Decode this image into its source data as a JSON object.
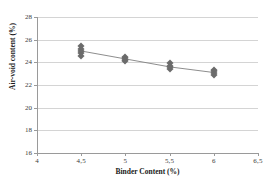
{
  "chart_data": {
    "type": "scatter",
    "title": "",
    "xlabel": "Binder Content (%)",
    "ylabel": "Air-void content (%)",
    "xlim": [
      4,
      6.5
    ],
    "ylim": [
      16,
      28
    ],
    "xticks": [
      "4",
      "4,5",
      "5",
      "5,5",
      "6",
      "6,5"
    ],
    "xtick_values": [
      4,
      4.5,
      5,
      5.5,
      6,
      6.5
    ],
    "yticks": [
      "16",
      "18",
      "20",
      "22",
      "24",
      "26",
      "28"
    ],
    "ytick_values": [
      16,
      18,
      20,
      22,
      24,
      26,
      28
    ],
    "grid": "horizontal",
    "legend": "none",
    "marker_color": "#6b6b6b",
    "marker_shape": "diamond",
    "line_color": "#808080",
    "grid_color": "#d4d4d4",
    "axis_color": "#9a9a9a",
    "series": [
      {
        "name": "Air-void content",
        "x": [
          4.5,
          4.5,
          4.5,
          4.5,
          4.5,
          5,
          5,
          5,
          5,
          5.5,
          5.5,
          5.5,
          5.5,
          6,
          6,
          6,
          6
        ],
        "y": [
          25.45,
          25.2,
          25.0,
          24.85,
          24.6,
          24.5,
          24.35,
          24.25,
          24.15,
          23.95,
          23.7,
          23.55,
          23.4,
          23.3,
          23.2,
          23.05,
          22.85
        ]
      }
    ],
    "trend_line": {
      "x": [
        4.5,
        5,
        5.5,
        6
      ],
      "y": [
        25.0,
        24.3,
        23.6,
        23.1
      ]
    }
  }
}
